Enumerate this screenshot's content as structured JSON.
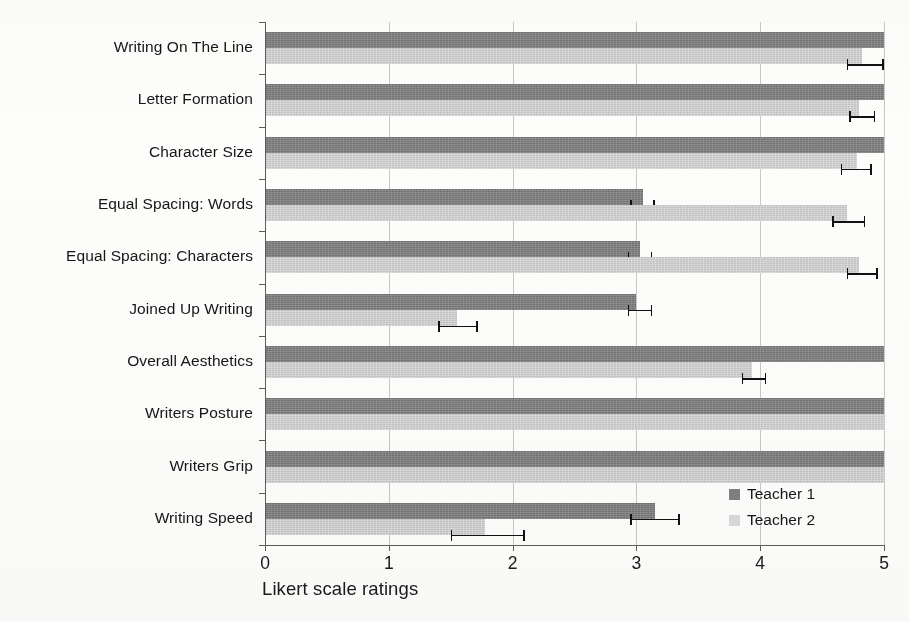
{
  "chart_data": {
    "type": "bar",
    "orientation": "horizontal",
    "title": "",
    "xlabel": "Likert scale ratings",
    "ylabel": "",
    "xlim": [
      0,
      5
    ],
    "xticks": [
      "0",
      "1",
      "2",
      "3",
      "4",
      "5"
    ],
    "grid": true,
    "legend_position": "lower-right",
    "categories": [
      "Writing On The Line",
      "Letter Formation",
      "Character Size",
      "Equal Spacing: Words",
      "Equal Spacing: Characters",
      "Joined Up Writing",
      "Overall Aesthetics",
      "Writers Posture",
      "Writers Grip",
      "Writing Speed"
    ],
    "series": [
      {
        "name": "Teacher 1",
        "color": "#7f7f7f",
        "values": [
          5.0,
          5.0,
          5.0,
          3.05,
          3.03,
          3.0,
          5.0,
          5.0,
          5.0,
          3.15
        ],
        "err_low": [
          5.0,
          5.0,
          5.0,
          2.95,
          2.93,
          2.93,
          5.0,
          5.0,
          5.0,
          2.95
        ],
        "err_high": [
          5.0,
          5.0,
          5.0,
          3.15,
          3.13,
          3.13,
          5.0,
          5.0,
          5.0,
          3.35
        ]
      },
      {
        "name": "Teacher 2",
        "color": "#d9d9d9",
        "values": [
          4.82,
          4.8,
          4.78,
          4.7,
          4.8,
          1.55,
          3.93,
          5.0,
          5.0,
          1.78
        ],
        "err_low": [
          4.7,
          4.72,
          4.65,
          4.58,
          4.7,
          1.4,
          3.85,
          5.0,
          5.0,
          1.5
        ],
        "err_high": [
          5.0,
          4.93,
          4.9,
          4.85,
          4.95,
          1.72,
          4.05,
          5.0,
          5.0,
          2.1
        ]
      }
    ]
  },
  "legend": {
    "entries": [
      {
        "label": "Teacher 1",
        "color": "#7f7f7f"
      },
      {
        "label": "Teacher 2",
        "color": "#d9d9d9"
      }
    ]
  },
  "axis": {
    "x_title": "Likert scale ratings",
    "x_tick_labels": [
      "0",
      "1",
      "2",
      "3",
      "4",
      "5"
    ]
  }
}
